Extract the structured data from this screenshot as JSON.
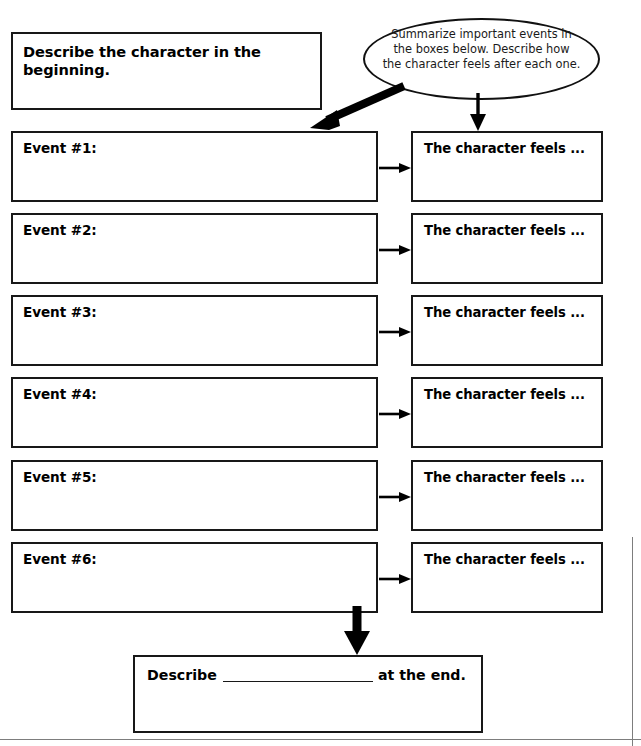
{
  "page": {
    "width": 641,
    "height": 746,
    "background": "#ffffff",
    "ink": "#181818",
    "rule_color": "#7d7d7d"
  },
  "beginning": {
    "label": "Describe the character in the beginning."
  },
  "callout": {
    "line1": "Summarize important events in",
    "line2": "the boxes below. Describe how",
    "line3": "the character feels after each one."
  },
  "rows": [
    {
      "event_label": "Event #1:",
      "feels_label": "The character feels ..."
    },
    {
      "event_label": "Event #2:",
      "feels_label": "The character feels ..."
    },
    {
      "event_label": "Event #3:",
      "feels_label": "The character feels ..."
    },
    {
      "event_label": "Event #4:",
      "feels_label": "The character feels ..."
    },
    {
      "event_label": "Event #5:",
      "feels_label": "The character feels ..."
    },
    {
      "event_label": "Event #6:",
      "feels_label": "The character feels ..."
    }
  ],
  "ending": {
    "prefix": "Describe",
    "blank": "",
    "suffix": "at the end."
  },
  "arrows": {
    "callout_to_event1": "thick-diagonal-arrow",
    "callout_to_feels1": "thin-down-arrow",
    "event_to_feels": "thin-right-arrow",
    "event6_to_ending": "thick-down-arrow"
  }
}
